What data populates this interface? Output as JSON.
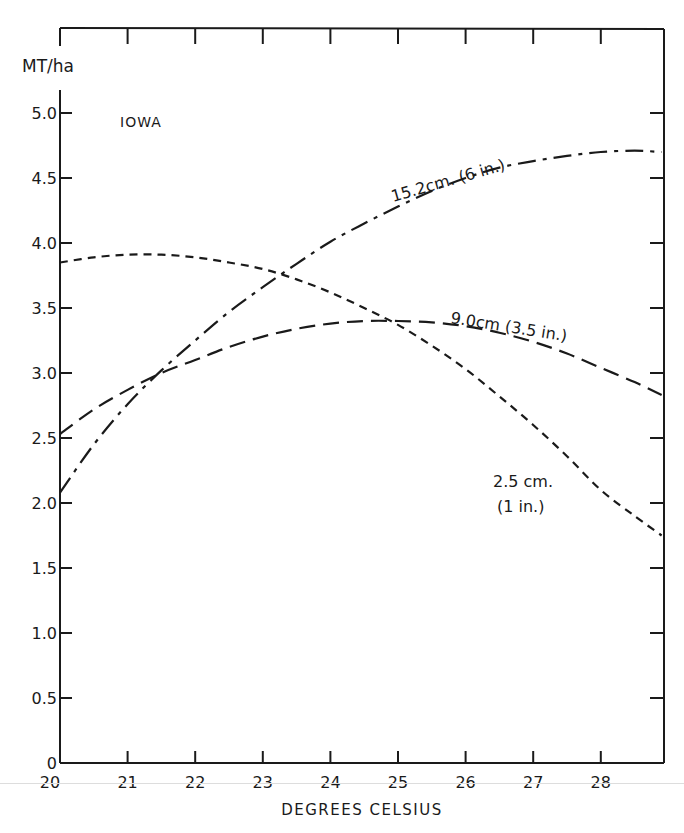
{
  "chart_data": {
    "type": "line",
    "title": "IOWA",
    "xlabel": "DEGREES CELSIUS",
    "ylabel": "MT/ha",
    "xlim": [
      20,
      28.9
    ],
    "ylim": [
      0,
      5.2
    ],
    "x_ticks": [
      "20",
      "21",
      "22",
      "23",
      "24",
      "25",
      "26",
      "27",
      "28"
    ],
    "y_ticks": [
      "0",
      "0.5",
      "1.0",
      "1.5",
      "2.0",
      "2.5",
      "3.0",
      "3.5",
      "4.0",
      "4.5",
      "5.0"
    ],
    "y_tick_values": [
      0,
      0.5,
      1.0,
      1.5,
      2.0,
      2.5,
      3.0,
      3.5,
      4.0,
      4.5,
      5.0
    ],
    "grid": false,
    "legend_position": "inline labels",
    "series": [
      {
        "name": "15.2cm. (6 in.)",
        "style": "dash-dot",
        "x": [
          20,
          20.5,
          21,
          21.5,
          22,
          22.5,
          23,
          23.5,
          24,
          24.5,
          25,
          25.5,
          26,
          26.5,
          27,
          27.5,
          28,
          28.5,
          28.9
        ],
        "values": [
          2.08,
          2.45,
          2.76,
          3.02,
          3.25,
          3.47,
          3.66,
          3.84,
          4.01,
          4.15,
          4.28,
          4.4,
          4.5,
          4.58,
          4.63,
          4.67,
          4.7,
          4.71,
          4.7
        ]
      },
      {
        "name": "9.0cm (3.5 in.)",
        "style": "long-dash",
        "x": [
          20,
          20.5,
          21,
          21.5,
          22,
          22.5,
          23,
          23.5,
          24,
          24.5,
          25,
          25.5,
          26,
          26.5,
          27,
          27.5,
          28,
          28.5,
          28.9
        ],
        "values": [
          2.53,
          2.72,
          2.87,
          3.0,
          3.1,
          3.2,
          3.28,
          3.34,
          3.38,
          3.4,
          3.4,
          3.39,
          3.36,
          3.31,
          3.24,
          3.15,
          3.04,
          2.93,
          2.83
        ]
      },
      {
        "name": "2.5 cm. (1 in.)",
        "style": "short-dash",
        "x": [
          20,
          20.5,
          21,
          21.5,
          22,
          22.5,
          23,
          23.5,
          24,
          24.5,
          25,
          25.5,
          26,
          26.5,
          27,
          27.5,
          28,
          28.5,
          28.9
        ],
        "values": [
          3.85,
          3.89,
          3.91,
          3.91,
          3.89,
          3.85,
          3.8,
          3.72,
          3.62,
          3.5,
          3.37,
          3.21,
          3.03,
          2.82,
          2.6,
          2.36,
          2.1,
          1.9,
          1.75
        ]
      }
    ],
    "annotations": [
      {
        "text": "IOWA",
        "x": 21.3,
        "y": 4.9
      },
      {
        "text": "15.2cm. (6 in.)",
        "x": 24.6,
        "y": 4.5
      },
      {
        "text": "9.0cm (3.5 in.)",
        "x": 25.6,
        "y": 3.38
      },
      {
        "text": "2.5 cm.",
        "x": 26.5,
        "y": 2.13
      },
      {
        "text": "(1 in.)",
        "x": 26.6,
        "y": 1.92
      }
    ]
  },
  "labels": {
    "y_unit": "MT/ha",
    "region": "IOWA",
    "x_axis_title": "DEGREES CELSIUS",
    "series_1": "15.2cm. (6 in.)",
    "series_2": "9.0cm (3.5 in.)",
    "series_3a": "2.5 cm.",
    "series_3b": "(1 in.)"
  }
}
